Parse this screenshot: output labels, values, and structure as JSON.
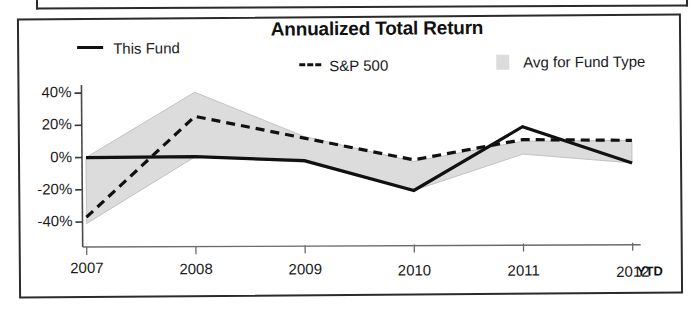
{
  "chart_data": {
    "type": "line",
    "title": "Annualized Total Return",
    "xlabel": "",
    "ylabel": "",
    "categories": [
      "2007",
      "2008",
      "2009",
      "2010",
      "2011",
      "2012"
    ],
    "x_tick_note": "YTD",
    "y_ticks": [
      "40%",
      "20%",
      "0%",
      "-20%",
      "-40%"
    ],
    "y_tick_values": [
      40,
      20,
      0,
      -20,
      -40
    ],
    "ylim": [
      -48,
      46
    ],
    "grid": false,
    "legend_position": "top",
    "series": [
      {
        "name": "This Fund",
        "style": "solid",
        "color": "#111111",
        "values": [
          0,
          0,
          -3,
          -22,
          17,
          -6
        ]
      },
      {
        "name": "S&P 500",
        "style": "dashed",
        "color": "#111111",
        "values": [
          -37,
          25,
          11,
          -3,
          9,
          8
        ]
      },
      {
        "name": "Avg for Fund Type",
        "style": "band",
        "color": "#dcdcdc",
        "band_upper": [
          0,
          40,
          12,
          -4,
          8,
          8
        ],
        "band_lower": [
          -41,
          0,
          -4,
          -22,
          0,
          -6
        ]
      }
    ]
  },
  "legend": {
    "items": [
      {
        "label": "This Fund",
        "marker": "solid-line-swatch"
      },
      {
        "label": "S&P 500",
        "marker": "dashed-line-swatch"
      },
      {
        "label": "Avg for Fund Type",
        "marker": "gray-box-swatch"
      }
    ]
  },
  "axis": {
    "y_labels": [
      "40%",
      "20%",
      "0%",
      "-20%",
      "-40%"
    ],
    "x_labels": [
      "2007",
      "2008",
      "2009",
      "2010",
      "2011",
      "2012"
    ],
    "ytd_note": "YTD"
  },
  "colors": {
    "line": "#111111",
    "band": "#dcdcdc",
    "frame": "#2b2b2b",
    "text": "#1a1a1a"
  }
}
